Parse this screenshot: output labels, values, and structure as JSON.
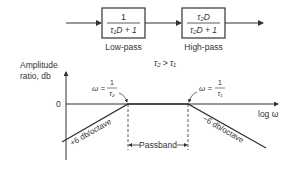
{
  "blocks": [
    {
      "numerator": "1",
      "denominator": "τ₁D + 1",
      "label": "Low-pass"
    },
    {
      "numerator": "τ₂D",
      "denominator": "τ₂D + 1",
      "label": "High-pass"
    }
  ],
  "condition": "τ₂ > τ₁",
  "axes": {
    "ylabel_line1": "Amplitude",
    "ylabel_line2": "ratio, db",
    "zero": "0",
    "xlabel": "log ω"
  },
  "annotations": {
    "break1": "ω = 1/τ₂",
    "break1_lhs": "ω =",
    "break1_num": "1",
    "break1_den": "τ₂",
    "break2_lhs": "ω =",
    "break2_num": "1",
    "break2_den": "τ₁",
    "slope_up": "+6 db/octave",
    "slope_down": "−6 db/octave",
    "passband": "Passband"
  }
}
